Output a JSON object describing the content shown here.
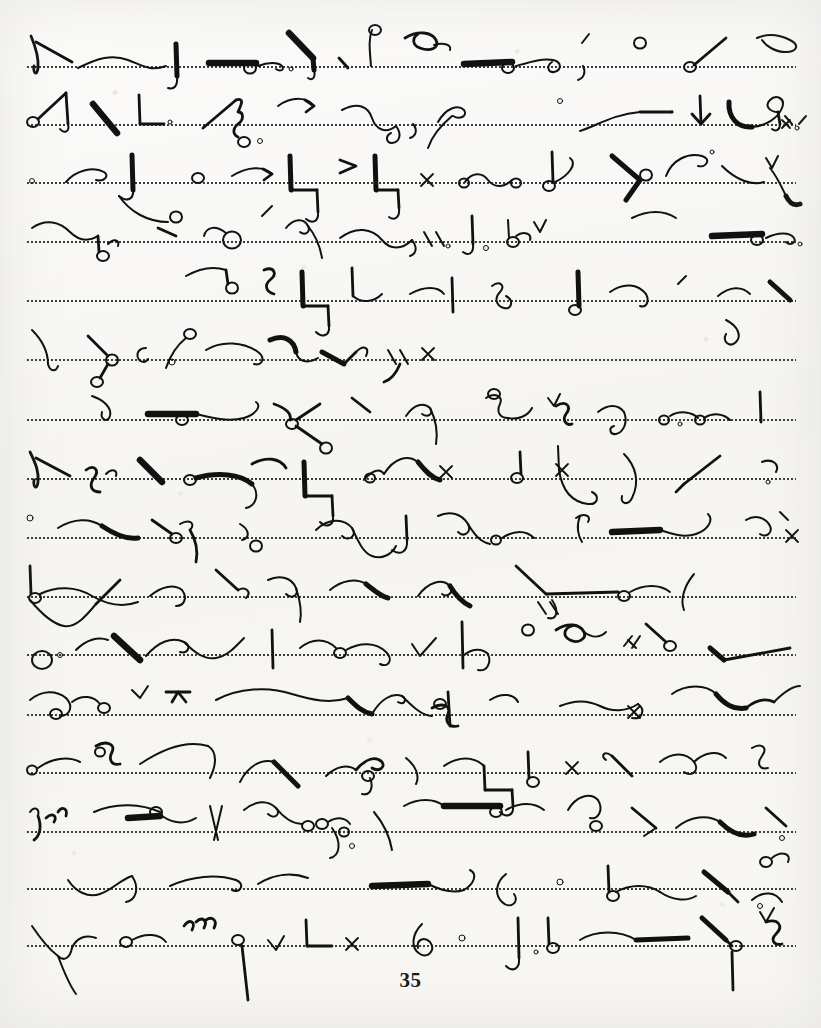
{
  "document": {
    "kind": "handwritten-shorthand-page",
    "script_system": "Gregg shorthand",
    "medium": "ink on dotted-ruled practice paper",
    "page_number": "35",
    "page_width": 821,
    "page_height": 1028
  },
  "colors": {
    "paper": "#f7f6f3",
    "ink": "#111111",
    "rule": "#2b2b2b",
    "page_number": "#1b1b1b"
  },
  "ruling": {
    "style": "dotted",
    "dot_pitch_px": 4,
    "left_px": 26,
    "right_px": 796,
    "line_y": [
      67,
      125,
      183,
      242,
      301,
      360,
      420,
      479,
      538,
      597,
      655,
      715,
      773,
      832,
      889,
      946
    ]
  },
  "footer": {
    "page_number": "35",
    "y": 968
  },
  "content": {
    "line_count": 16,
    "transcription_available": false,
    "note": "Shorthand outlines are non-alphabetic pen strokes; no readable Latin text appears except the page number."
  }
}
